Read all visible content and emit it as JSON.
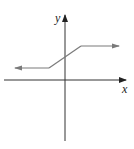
{
  "diagram": {
    "type": "function-graph",
    "axes": {
      "x_label": "x",
      "y_label": "y",
      "axis_color": "#333333"
    },
    "curve": {
      "description": "piecewise linear: constant, rising segment, constant",
      "color": "#7a7a7a",
      "segments": [
        {
          "kind": "ray-left",
          "from": [
            -1,
            1
          ],
          "direction": "left"
        },
        {
          "kind": "segment",
          "from": [
            -1,
            1
          ],
          "to": [
            1,
            2
          ]
        },
        {
          "kind": "ray-right",
          "from": [
            1,
            2
          ],
          "direction": "right"
        }
      ]
    }
  }
}
